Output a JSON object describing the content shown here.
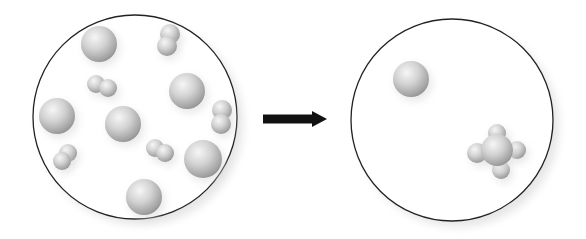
{
  "diagram": {
    "before": {
      "label": "before-container",
      "circle": {
        "cx": 135,
        "cy": 117,
        "r": 102
      },
      "single_spheres": [
        {
          "x": 99,
          "y": 44,
          "r": 18
        },
        {
          "x": 187,
          "y": 91,
          "r": 18
        },
        {
          "x": 57,
          "y": 116,
          "r": 18
        },
        {
          "x": 123,
          "y": 124,
          "r": 18
        },
        {
          "x": 203,
          "y": 159,
          "r": 19
        },
        {
          "x": 144,
          "y": 197,
          "r": 18
        }
      ],
      "diatomic_molecules": [
        {
          "a": {
            "x": 170,
            "y": 34,
            "r": 10
          },
          "b": {
            "x": 167,
            "y": 46,
            "r": 10
          }
        },
        {
          "a": {
            "x": 96,
            "y": 84,
            "r": 9
          },
          "b": {
            "x": 108,
            "y": 88,
            "r": 9
          }
        },
        {
          "a": {
            "x": 222,
            "y": 110,
            "r": 10
          },
          "b": {
            "x": 221,
            "y": 124,
            "r": 10
          }
        },
        {
          "a": {
            "x": 68,
            "y": 153,
            "r": 9
          },
          "b": {
            "x": 62,
            "y": 161,
            "r": 9
          }
        },
        {
          "a": {
            "x": 155,
            "y": 148,
            "r": 9
          },
          "b": {
            "x": 165,
            "y": 153,
            "r": 9
          }
        }
      ]
    },
    "arrow": {
      "x1": 263,
      "x2": 327,
      "y": 119,
      "color": "#111111"
    },
    "after": {
      "label": "after-container",
      "circle": {
        "cx": 452,
        "cy": 120,
        "r": 101
      },
      "single_spheres": [
        {
          "x": 411,
          "y": 79,
          "r": 18
        }
      ],
      "cluster": {
        "center": {
          "x": 497,
          "y": 150,
          "r": 16
        },
        "lobes": [
          {
            "x": 497,
            "y": 133,
            "r": 9
          },
          {
            "x": 517,
            "y": 150,
            "r": 9
          },
          {
            "x": 477,
            "y": 153,
            "r": 10
          },
          {
            "x": 501,
            "y": 170,
            "r": 9
          }
        ]
      }
    },
    "colors": {
      "circle_stroke": "#222222",
      "sphere_light": "#f2f2f2",
      "sphere_mid": "#c6c6c6",
      "sphere_dark": "#8e8e8e"
    }
  }
}
